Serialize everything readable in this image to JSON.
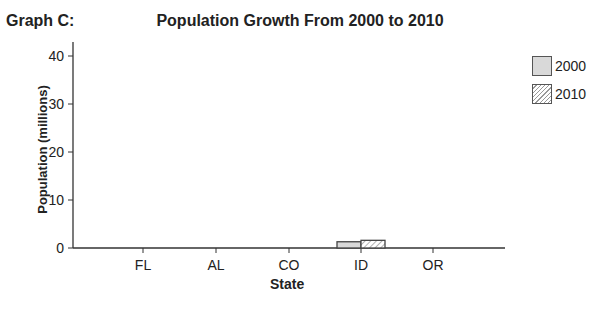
{
  "graph_label": "Graph C:",
  "chart_data": {
    "type": "bar",
    "title": "Population Growth From 2000 to 2010",
    "xlabel": "State",
    "ylabel": "Population (millions)",
    "categories": [
      "FL",
      "AL",
      "CO",
      "ID",
      "OR"
    ],
    "series": [
      {
        "name": "2000",
        "values": [
          null,
          null,
          null,
          1.3,
          null
        ],
        "fill": "#d9d9d9"
      },
      {
        "name": "2010",
        "values": [
          null,
          null,
          null,
          1.6,
          null
        ],
        "fill": "hatched"
      }
    ],
    "yticks": [
      0,
      10,
      20,
      30,
      40
    ],
    "ylim": [
      0,
      40
    ],
    "grid": false,
    "legend_position": "top-right"
  },
  "legend": {
    "items": [
      {
        "label": "2000"
      },
      {
        "label": "2010"
      }
    ]
  }
}
